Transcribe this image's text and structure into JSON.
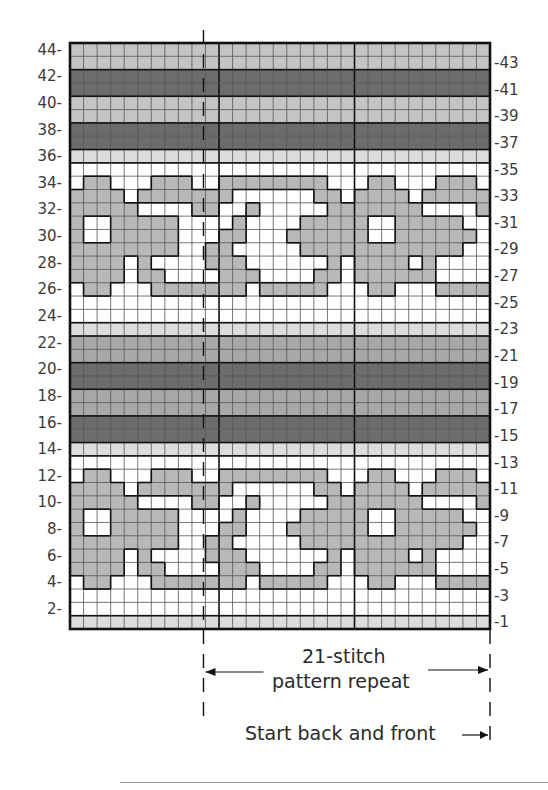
{
  "chart_data": {
    "type": "knitting-chart",
    "title": "",
    "grid": {
      "columns": 31,
      "rows": 44
    },
    "left_labels": [
      "44",
      "42",
      "40",
      "38",
      "36",
      "34",
      "32",
      "30",
      "28",
      "26",
      "24",
      "22",
      "20",
      "18",
      "16",
      "14",
      "12",
      "10",
      "8",
      "6",
      "4",
      "2"
    ],
    "right_labels": [
      "43",
      "41",
      "39",
      "37",
      "35",
      "33",
      "31",
      "29",
      "27",
      "25",
      "23",
      "21",
      "19",
      "17",
      "15",
      "13",
      "11",
      "9",
      "7",
      "5",
      "3",
      "1"
    ],
    "colors": {
      "W": "#ffffff",
      "V": "#dcdcdc",
      "L": "#c4c4c4",
      "M": "#a8a8a8",
      "D": "#6c6c6c",
      "G": "#b8b8b8",
      "grid_line": "#555555",
      "heavy_line": "#111111"
    },
    "row_bands": {
      "44": "L",
      "43": "L",
      "42": "D",
      "41": "D",
      "40": "L",
      "39": "L",
      "38": "D",
      "37": "D",
      "36": "V",
      "35": "W",
      "25": "W",
      "24": "W",
      "23": "V",
      "22": "M",
      "21": "M",
      "20": "D",
      "19": "D",
      "18": "M",
      "17": "M",
      "16": "D",
      "15": "D",
      "14": "V",
      "13": "W",
      "3": "W",
      "2": "W",
      "1": "V"
    },
    "motif_rows_upper_start": 34,
    "motif_rows_lower_start": 12,
    "motif": [
      "WGGWWWGGGWWGGGGGGGGWWWGGWWWGGGW",
      "GGGGWGGGGGGGWWWWWWGGWGGGGWGGGGG",
      "GGGGGWWWWGGWWGWWWWWGGGGGGGWWWWG",
      "GWWGGGGGWWWWGWWWWGGGGGWWGGGGGWW",
      "GWWGGGGGWWWGGWWWGGGGGGWWGGGGGGW",
      "GGGGGGGGWWGGWWWWWGGGGGGGGGGGGWW",
      "GGGGWGWWWWGGGWWWWWWGWGGGGWGWWWW",
      "GGGGWGGWWWWGGGWWWWGGWGGGGGGWWWW",
      "WGGWWWGGGGGGGWGGGGGWWWGGWWWGGGG"
    ],
    "repeat_marker_columns": {
      "start_after_col": 10,
      "end_after_col": 31
    },
    "heavy_vertical_after_cols": [
      11,
      21
    ],
    "annotations": {
      "repeat_label_line1": "21-stitch",
      "repeat_label_line2": "pattern repeat",
      "start_label": "Start back and front"
    }
  }
}
